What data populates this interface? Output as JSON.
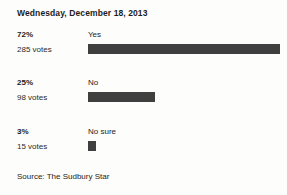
{
  "title": "Wednesday, December 18, 2013",
  "source": "Source: The Sudbury Star",
  "style": {
    "bar_color": "#3f3f3f",
    "background": "#fdfdfb",
    "text_color": "#1c1c1c"
  },
  "rows": [
    {
      "option": "Yes",
      "percent_label": "72%",
      "votes_label": "285 votes",
      "percent": 72,
      "votes": 285
    },
    {
      "option": "No",
      "percent_label": "25%",
      "votes_label": "98 votes",
      "percent": 25,
      "votes": 98
    },
    {
      "option": "No sure",
      "percent_label": "3%",
      "votes_label": "15 votes",
      "percent": 3,
      "votes": 15
    }
  ],
  "chart_data": {
    "type": "bar",
    "orientation": "horizontal",
    "title": "Wednesday, December 18, 2013",
    "categories": [
      "Yes",
      "No",
      "No sure"
    ],
    "values": [
      72,
      25,
      3
    ],
    "value_unit": "percent",
    "counts": [
      285,
      98,
      15
    ],
    "total_votes": 398,
    "xlabel": "",
    "ylabel": "",
    "xlim": [
      0,
      100
    ],
    "grid": false,
    "legend": false,
    "data_labels": [
      "72%",
      "25%",
      "3%"
    ],
    "count_labels": [
      "285 votes",
      "98 votes",
      "15 votes"
    ],
    "annotation": "Source: The Sudbury Star"
  }
}
